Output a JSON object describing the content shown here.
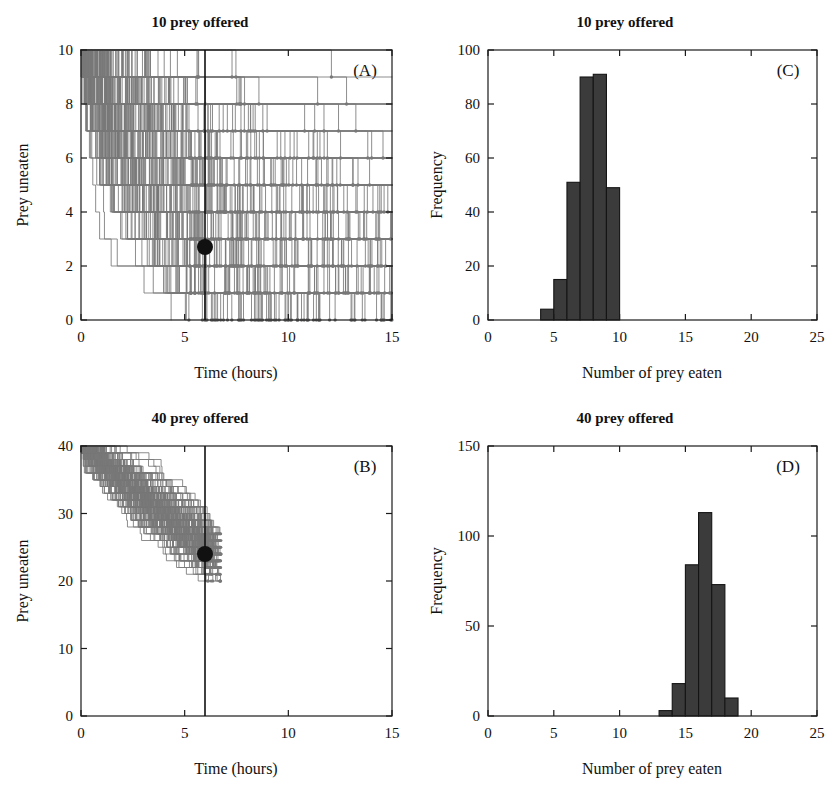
{
  "figure": {
    "width": 840,
    "height": 792,
    "background": "#ffffff",
    "trace_color": "#787878",
    "bar_color": "#3b3b3b",
    "marker_color": "#111111"
  },
  "panels": [
    {
      "id": "A",
      "letter": "(A)",
      "title": "10 prey offered",
      "xlabel": "Time (hours)",
      "ylabel": "Prey uneaten"
    },
    {
      "id": "B",
      "letter": "(B)",
      "title": "40 prey offered",
      "xlabel": "Time (hours)",
      "ylabel": "Prey uneaten"
    },
    {
      "id": "C",
      "letter": "(C)",
      "title": "10 prey offered",
      "xlabel": "Number of prey eaten",
      "ylabel": "Frequency"
    },
    {
      "id": "D",
      "letter": "(D)",
      "title": "40 prey offered",
      "xlabel": "Number of prey eaten",
      "ylabel": "Frequency"
    }
  ],
  "chart_data": [
    {
      "panel": "A",
      "type": "line",
      "title": "10 prey offered",
      "xlabel": "Time (hours)",
      "ylabel": "Prey uneaten",
      "xlim": [
        0,
        15
      ],
      "ylim": [
        0,
        10
      ],
      "xticks": [
        0,
        5,
        10,
        15
      ],
      "yticks": [
        0,
        2,
        4,
        6,
        8,
        10
      ],
      "xtick_labels": [
        "0",
        "5",
        "10",
        "15"
      ],
      "ytick_labels": [
        "0",
        "2",
        "4",
        "6",
        "8",
        "10"
      ],
      "grid": false,
      "legend": false,
      "description": "Simulated depletion trajectories: 200 stepped curves starting at 10 prey at time 0 and decreasing over time; each step ends in a small grey dot.",
      "n_traces": 200,
      "start_value": 10,
      "annotations": [
        {
          "name": "observation-time-line",
          "type": "vline",
          "x": 6,
          "color": "#111111"
        },
        {
          "name": "mean-prey-uneaten-dot",
          "type": "point",
          "x": 6,
          "y": 2.7,
          "color": "#111111"
        }
      ],
      "trace_endpoints_x": [
        3.6,
        4.3,
        4.6,
        5.0,
        5.2,
        5.5,
        5.8,
        6.1,
        6.4,
        6.7,
        6.9,
        7.2,
        7.6,
        8.0,
        8.4,
        8.8,
        9.3,
        9.8,
        10.4,
        11.2,
        12.1,
        13.2,
        13.8,
        14.6,
        15.0
      ],
      "trace_endpoints_y": [
        0,
        0,
        0,
        0,
        0,
        0,
        1,
        1,
        1,
        1,
        1,
        1,
        2,
        2,
        2,
        3,
        3,
        3,
        4,
        4,
        5,
        1,
        1,
        1,
        0
      ]
    },
    {
      "panel": "B",
      "type": "line",
      "title": "40 prey offered",
      "xlabel": "Time (hours)",
      "ylabel": "Prey uneaten",
      "xlim": [
        0,
        15
      ],
      "ylim": [
        0,
        40
      ],
      "xticks": [
        0,
        5,
        10,
        15
      ],
      "yticks": [
        0,
        10,
        20,
        30,
        40
      ],
      "xtick_labels": [
        "0",
        "5",
        "10",
        "15"
      ],
      "ytick_labels": [
        "0",
        "10",
        "20",
        "30",
        "40"
      ],
      "grid": false,
      "legend": false,
      "description": "Simulated depletion trajectories: 200 stepped curves starting at 40 prey at time 0, fanning down to roughly 20-27 prey uneaten by 6 hours where all trajectories stop.",
      "n_traces": 200,
      "start_value": 40,
      "annotations": [
        {
          "name": "observation-time-line",
          "type": "vline",
          "x": 6,
          "color": "#111111"
        },
        {
          "name": "mean-prey-uneaten-dot",
          "type": "point",
          "x": 6,
          "y": 24,
          "color": "#111111"
        }
      ],
      "endpoint_range_y": [
        20,
        27
      ]
    },
    {
      "panel": "C",
      "type": "bar",
      "title": "10 prey offered",
      "xlabel": "Number of prey eaten",
      "ylabel": "Frequency",
      "xlim": [
        0,
        25
      ],
      "ylim": [
        0,
        100
      ],
      "xticks": [
        0,
        5,
        10,
        15,
        20,
        25
      ],
      "yticks": [
        0,
        20,
        40,
        60,
        80,
        100
      ],
      "xtick_labels": [
        "0",
        "5",
        "10",
        "15",
        "20",
        "25"
      ],
      "ytick_labels": [
        "0",
        "20",
        "40",
        "60",
        "80",
        "100"
      ],
      "grid": false,
      "legend": false,
      "bin_width": 1,
      "bin_starts": [
        4,
        5,
        6,
        7,
        8,
        9
      ],
      "categories": [
        "4",
        "5",
        "6",
        "7",
        "8",
        "9"
      ],
      "values": [
        4,
        15,
        51,
        90,
        91,
        49
      ]
    },
    {
      "panel": "D",
      "type": "bar",
      "title": "40 prey offered",
      "xlabel": "Number of prey eaten",
      "ylabel": "Frequency",
      "xlim": [
        0,
        25
      ],
      "ylim": [
        0,
        150
      ],
      "xticks": [
        0,
        5,
        10,
        15,
        20,
        25
      ],
      "yticks": [
        0,
        50,
        100,
        150
      ],
      "xtick_labels": [
        "0",
        "5",
        "10",
        "15",
        "20",
        "25"
      ],
      "ytick_labels": [
        "0",
        "50",
        "100",
        "150"
      ],
      "grid": false,
      "legend": false,
      "bin_width": 1,
      "bin_starts": [
        13,
        14,
        15,
        16,
        17,
        18
      ],
      "categories": [
        "13",
        "14",
        "15",
        "16",
        "17",
        "18"
      ],
      "values": [
        3,
        18,
        84,
        113,
        73,
        10
      ]
    }
  ]
}
